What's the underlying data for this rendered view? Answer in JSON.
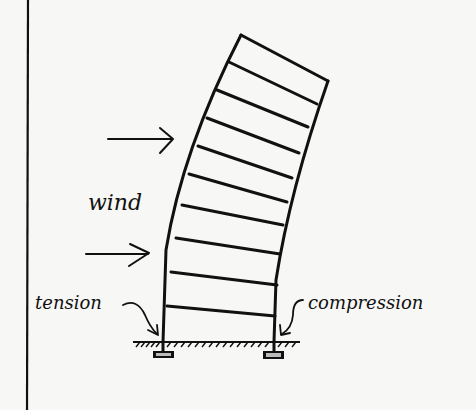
{
  "diagram": {
    "type": "structural-sketch",
    "labels": {
      "wind": "wind",
      "tension": "tension",
      "compression": "compression"
    },
    "floors": 10,
    "arrows": [
      {
        "name": "wind-arrow-upper",
        "direction": "right"
      },
      {
        "name": "wind-arrow-lower",
        "direction": "right"
      }
    ],
    "colors": {
      "ink": "#111111",
      "paper": "#f7f7f5"
    }
  }
}
